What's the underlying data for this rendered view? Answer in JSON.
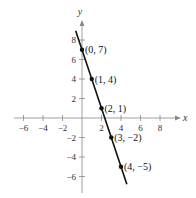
{
  "chart_data": {
    "type": "line",
    "title": "",
    "xlabel": "x",
    "ylabel": "y",
    "xlim": [
      -7,
      10
    ],
    "ylim": [
      -7,
      9
    ],
    "grid": false,
    "x_ticks": [
      -6,
      -4,
      -2,
      2,
      4,
      6,
      8
    ],
    "y_ticks": [
      -6,
      -4,
      -2,
      2,
      4,
      6,
      8
    ],
    "x_tick_labels": [
      "−6",
      "−4",
      "−2",
      "2",
      "4",
      "6",
      "8"
    ],
    "y_tick_labels": [
      "−6",
      "−4",
      "−2",
      "2",
      "4",
      "6",
      "8"
    ],
    "line": {
      "slope": -3,
      "intercept": 7,
      "x_start": -0.65,
      "x_end": 4.6
    },
    "points": [
      {
        "x": 0,
        "y": 7,
        "label": "(0, 7)"
      },
      {
        "x": 1,
        "y": 4,
        "label": "(1, 4)"
      },
      {
        "x": 2,
        "y": 1,
        "label": "(2, 1)"
      },
      {
        "x": 3,
        "y": -2,
        "label": "(3, −2)"
      },
      {
        "x": 4,
        "y": -5,
        "label": "(4, −5)"
      }
    ]
  },
  "colors": {
    "axis": "#888888",
    "line": "#111111",
    "point": "#111111"
  }
}
